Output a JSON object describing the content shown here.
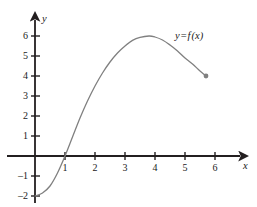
{
  "figure": {
    "title": "",
    "background_color": "#ffffff",
    "width": 257,
    "height": 207
  },
  "axes": {
    "x_axis_label": "x",
    "y_axis_label": "y",
    "axis_color": "#231f20",
    "origin_px": {
      "x": 35,
      "y": 156
    },
    "x_unit_px": 30,
    "y_unit_px": 20
  },
  "annotation": {
    "curve_label_y": "y",
    "curve_label_eq": "=",
    "curve_label_f": "f",
    "curve_label_arg": "(x)",
    "curve_label_full": "y = f (x)",
    "position_px": {
      "x": 175,
      "y": 31
    }
  },
  "chart_data": {
    "type": "line",
    "title": "",
    "xlabel": "x",
    "ylabel": "y",
    "xlim": [
      -0.35,
      7.0
    ],
    "ylim": [
      -2.6,
      6.9
    ],
    "grid": false,
    "legend": null,
    "x_ticks": [
      1,
      2,
      3,
      4,
      5,
      6
    ],
    "x_tick_labels": [
      "1",
      "2",
      "3",
      "4",
      "5",
      "6"
    ],
    "y_ticks": [
      -2,
      -1,
      1,
      2,
      3,
      4,
      5,
      6
    ],
    "y_tick_labels": [
      "–2",
      "–1",
      "1",
      "2",
      "3",
      "4",
      "5",
      "6"
    ],
    "series": [
      {
        "name": "y = f (x)",
        "color": "#808080",
        "line_width": 1.3,
        "points": [
          {
            "x": 0.0,
            "y": -2.0
          },
          {
            "x": 0.25,
            "y": -1.85
          },
          {
            "x": 0.5,
            "y": -1.5
          },
          {
            "x": 0.75,
            "y": -0.85
          },
          {
            "x": 1.0,
            "y": 0.0
          },
          {
            "x": 1.25,
            "y": 0.95
          },
          {
            "x": 1.5,
            "y": 1.9
          },
          {
            "x": 1.75,
            "y": 2.75
          },
          {
            "x": 2.0,
            "y": 3.5
          },
          {
            "x": 2.25,
            "y": 4.15
          },
          {
            "x": 2.5,
            "y": 4.7
          },
          {
            "x": 2.75,
            "y": 5.15
          },
          {
            "x": 3.0,
            "y": 5.5
          },
          {
            "x": 3.25,
            "y": 5.78
          },
          {
            "x": 3.5,
            "y": 5.93
          },
          {
            "x": 3.8,
            "y": 6.0
          },
          {
            "x": 4.0,
            "y": 5.95
          },
          {
            "x": 4.25,
            "y": 5.8
          },
          {
            "x": 4.5,
            "y": 5.55
          },
          {
            "x": 4.75,
            "y": 5.25
          },
          {
            "x": 5.0,
            "y": 4.9
          },
          {
            "x": 5.25,
            "y": 4.6
          },
          {
            "x": 5.5,
            "y": 4.25
          },
          {
            "x": 5.7,
            "y": 4.0
          }
        ],
        "endpoint_marker": {
          "x": 5.7,
          "y": 4.0,
          "style": "filled-dot"
        },
        "start_point": {
          "x": 0.0,
          "y": -2.0
        },
        "x_intercept": {
          "x": 1.0,
          "y": 0.0
        },
        "maximum": {
          "x": 3.8,
          "y": 6.0
        }
      }
    ]
  }
}
